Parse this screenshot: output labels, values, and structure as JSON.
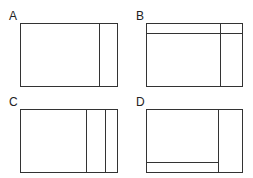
{
  "diagram": {
    "panels": [
      {
        "label": "A",
        "description": "Rectangle with one vertical divider on the right"
      },
      {
        "label": "B",
        "description": "Rectangle with a horizontal strip at top and a vertical divider on the right"
      },
      {
        "label": "C",
        "description": "Rectangle with two vertical dividers on the right"
      },
      {
        "label": "D",
        "description": "Rectangle with a vertical divider on the right and a horizontal strip at bottom of the left section"
      }
    ]
  },
  "colors": {
    "stroke": "#333333",
    "background": "#ffffff"
  }
}
